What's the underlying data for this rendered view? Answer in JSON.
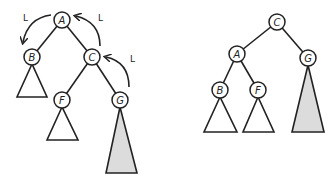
{
  "colors": {
    "stroke": "#222222",
    "node_fill": "#ffffff",
    "empty_subtree": "#ffffff",
    "shaded_subtree": "#dcdcdc"
  },
  "before": {
    "nodes": [
      {
        "id": "A",
        "label": "A",
        "x": 62,
        "y": 20
      },
      {
        "id": "B",
        "label": "B",
        "x": 32,
        "y": 57
      },
      {
        "id": "C",
        "label": "C",
        "x": 92,
        "y": 57
      },
      {
        "id": "F",
        "label": "F",
        "x": 62,
        "y": 100
      },
      {
        "id": "G",
        "label": "G",
        "x": 120,
        "y": 100
      }
    ],
    "rotation_labels": [
      "L",
      "L",
      "L"
    ]
  },
  "after": {
    "nodes": [
      {
        "id": "C",
        "label": "C",
        "x": 277,
        "y": 22
      },
      {
        "id": "A",
        "label": "A",
        "x": 237,
        "y": 54
      },
      {
        "id": "G",
        "label": "G",
        "x": 308,
        "y": 58
      },
      {
        "id": "B",
        "label": "B",
        "x": 220,
        "y": 90
      },
      {
        "id": "F",
        "label": "F",
        "x": 258,
        "y": 90
      }
    ]
  }
}
